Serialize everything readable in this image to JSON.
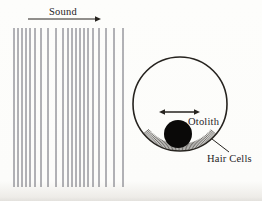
{
  "figure": {
    "labels": {
      "sound": "Sound",
      "otolith": "Otolith",
      "hair_cells": "Hair Cells"
    },
    "colors": {
      "ink": "#26231f",
      "wave_line": "#565660",
      "otolith_fill": "#0a0908",
      "background": "#fcfcfa"
    },
    "sound_wave": {
      "line_xs": [
        14,
        18,
        22,
        26,
        30,
        35,
        41,
        48,
        56,
        63,
        68,
        72,
        76,
        80,
        84,
        88,
        93,
        99,
        106,
        114,
        123
      ],
      "top": 28,
      "bottom": 187,
      "stroke_width": 0.9
    },
    "sound_arrow": {
      "x1": 28,
      "y1": 19,
      "x2": 101,
      "y2": 19,
      "heads": "end",
      "stroke_width": 1.1
    },
    "membrane_circle": {
      "cx": 180,
      "cy": 104,
      "r": 47,
      "stroke_width": 1.6
    },
    "hatch": {
      "start_deg": 40,
      "end_deg": 142,
      "step_deg": 1.8,
      "r_inner": 40,
      "r_outer": 46.6,
      "stroke_width": 0.65
    },
    "otolith_circle": {
      "cx": 178,
      "cy": 134,
      "r": 14
    },
    "motion_arrow": {
      "x1": 159,
      "y1": 112,
      "x2": 200,
      "y2": 112,
      "heads": "both",
      "stroke_width": 1.4
    },
    "leader_line": {
      "x1": 212,
      "y1": 139,
      "x2": 229,
      "y2": 152,
      "stroke_width": 1
    }
  }
}
